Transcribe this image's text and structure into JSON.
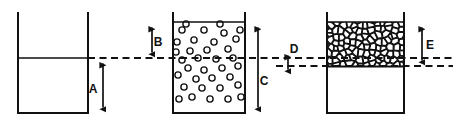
{
  "figure": {
    "background_color": "#ffffff",
    "ink_color": "#111111",
    "width": 453,
    "height": 124
  },
  "reference_lines": {
    "upper_level_label": "upper datum line",
    "lower_level_label": "lower datum line",
    "style": "dashed"
  },
  "vessels": [
    {
      "id": "vessel-empty",
      "name": "empty-vessel",
      "contents": "none",
      "fill_pattern": "blank",
      "left": 18,
      "right": 88,
      "top": 12,
      "bottom": 113,
      "content_top": 58
    },
    {
      "id": "vessel-fluidized",
      "name": "fluidized-bed-vessel",
      "contents": "dispersed particles",
      "fill_pattern": "circles",
      "left": 173,
      "right": 245,
      "top": 12,
      "bottom": 113,
      "content_top": 22
    },
    {
      "id": "vessel-packed",
      "name": "packed-bed-vessel",
      "contents": "packed granular bed",
      "fill_pattern": "polygons",
      "left": 327,
      "right": 404,
      "top": 12,
      "bottom": 113,
      "content_top": 22,
      "content_bottom": 66
    }
  ],
  "dimensions": [
    {
      "key": "A",
      "label": "A",
      "name": "dimension-a",
      "vessel": "vessel-empty",
      "from_y": 58,
      "to_y": 113,
      "x": 103,
      "label_x": 93,
      "label_y": 90,
      "arrows": "both"
    },
    {
      "key": "B",
      "label": "B",
      "name": "dimension-b",
      "vessel": "vessel-fluidized",
      "from_y": 22,
      "to_y": 58,
      "x": 152,
      "label_x": 158,
      "label_y": 43,
      "arrows": "both"
    },
    {
      "key": "C",
      "label": "C",
      "name": "dimension-c",
      "vessel": "vessel-fluidized",
      "from_y": 22,
      "to_y": 113,
      "x": 258,
      "label_x": 264,
      "label_y": 82,
      "arrows": "both"
    },
    {
      "key": "D",
      "label": "D",
      "name": "dimension-d",
      "vessel": "vessel-packed",
      "from_y": 50,
      "to_y": 75,
      "x": 288,
      "label_x": 294,
      "label_y": 50,
      "arrows": "both"
    },
    {
      "key": "E",
      "label": "E",
      "name": "dimension-e",
      "vessel": "vessel-packed",
      "from_y": 22,
      "to_y": 66,
      "x": 422,
      "label_x": 430,
      "label_y": 46,
      "arrows": "both"
    }
  ],
  "particles": {
    "circle_radius": 3.1,
    "stroke_width": 1.4,
    "positions": [
      [
        182,
        30
      ],
      [
        204,
        30
      ],
      [
        224,
        33
      ],
      [
        194,
        40
      ],
      [
        214,
        42
      ],
      [
        236,
        39
      ],
      [
        176,
        52
      ],
      [
        190,
        51
      ],
      [
        207,
        50
      ],
      [
        228,
        49
      ],
      [
        240,
        30
      ],
      [
        182,
        60
      ],
      [
        198,
        58
      ],
      [
        216,
        59
      ],
      [
        233,
        58
      ],
      [
        188,
        68
      ],
      [
        204,
        70
      ],
      [
        222,
        68
      ],
      [
        238,
        66
      ],
      [
        178,
        75
      ],
      [
        196,
        79
      ],
      [
        212,
        78
      ],
      [
        230,
        77
      ],
      [
        184,
        87
      ],
      [
        202,
        88
      ],
      [
        220,
        88
      ],
      [
        238,
        85
      ],
      [
        179,
        99
      ],
      [
        192,
        97
      ],
      [
        210,
        99
      ],
      [
        228,
        99
      ],
      [
        241,
        97
      ],
      [
        177,
        42
      ],
      [
        220,
        24
      ],
      [
        186,
        24
      ]
    ]
  },
  "packed_bed": {
    "seed_note": "voronoi-like polygonal granular texture",
    "stroke_width": 1.3
  }
}
